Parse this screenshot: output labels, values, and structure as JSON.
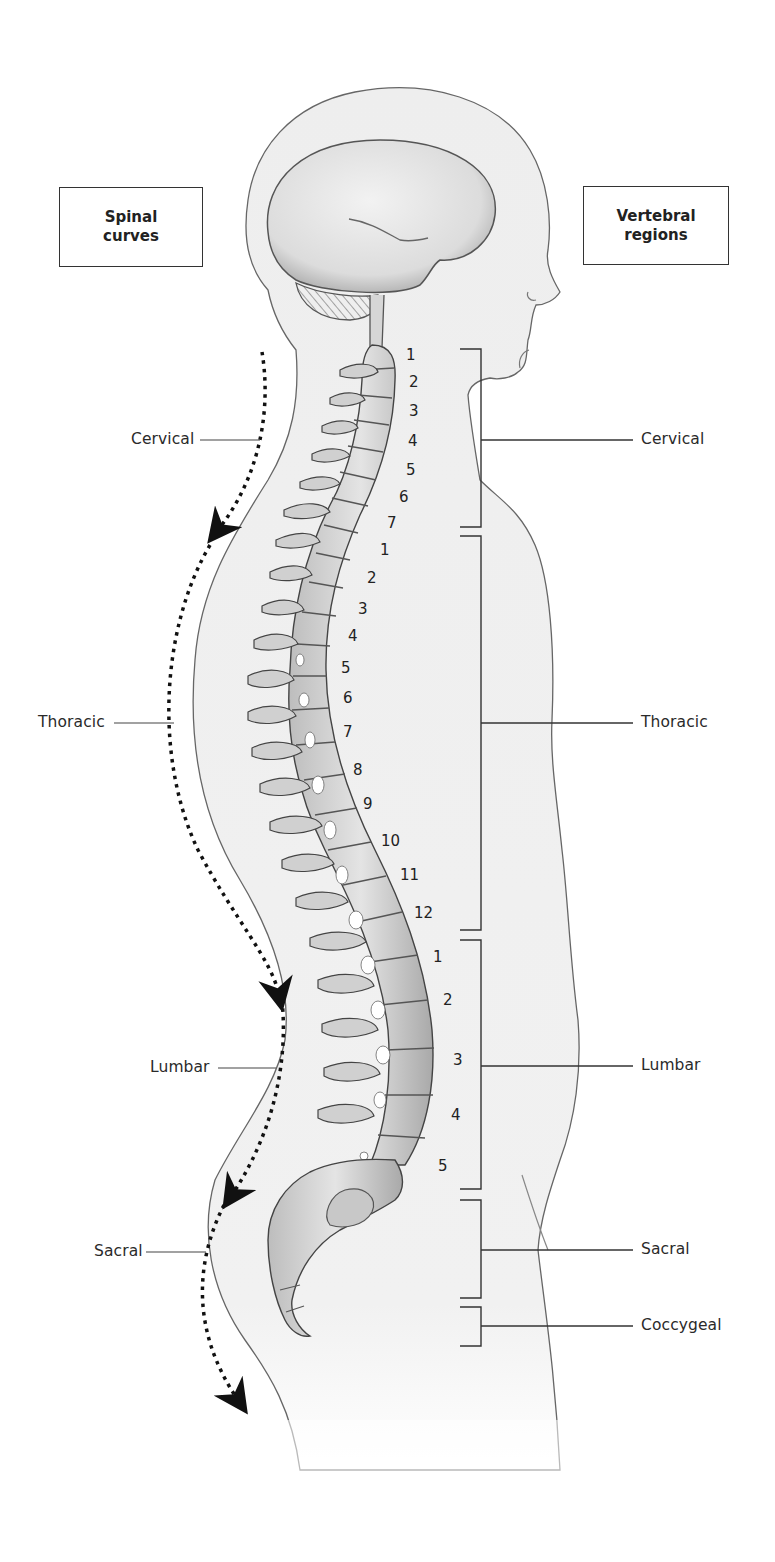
{
  "diagram": {
    "left_box": {
      "line1": "Spinal",
      "line2": "curves"
    },
    "right_box": {
      "line1": "Vertebral",
      "line2": "regions"
    },
    "spinal_curves": [
      {
        "label": "Cervical",
        "x": 131,
        "y": 430
      },
      {
        "label": "Thoracic",
        "x": 38,
        "y": 714
      },
      {
        "label": "Lumbar",
        "x": 150,
        "y": 1058
      },
      {
        "label": "Sacral",
        "x": 94,
        "y": 1242
      }
    ],
    "vertebral_regions": [
      {
        "label": "Cervical",
        "x": 641,
        "y": 430
      },
      {
        "label": "Thoracic",
        "x": 641,
        "y": 714
      },
      {
        "label": "Lumbar",
        "x": 641,
        "y": 1056
      },
      {
        "label": "Sacral",
        "x": 641,
        "y": 1240
      },
      {
        "label": "Coccygeal",
        "x": 641,
        "y": 1318
      }
    ],
    "vertebra_numbers": {
      "cervical": [
        {
          "n": "1",
          "x": 406,
          "y": 346
        },
        {
          "n": "2",
          "x": 409,
          "y": 373
        },
        {
          "n": "3",
          "x": 409,
          "y": 402
        },
        {
          "n": "4",
          "x": 408,
          "y": 432
        },
        {
          "n": "5",
          "x": 406,
          "y": 461
        },
        {
          "n": "6",
          "x": 399,
          "y": 488
        },
        {
          "n": "7",
          "x": 387,
          "y": 514
        }
      ],
      "thoracic": [
        {
          "n": "1",
          "x": 380,
          "y": 541
        },
        {
          "n": "2",
          "x": 367,
          "y": 569
        },
        {
          "n": "3",
          "x": 358,
          "y": 600
        },
        {
          "n": "4",
          "x": 348,
          "y": 627
        },
        {
          "n": "5",
          "x": 341,
          "y": 659
        },
        {
          "n": "6",
          "x": 343,
          "y": 689
        },
        {
          "n": "7",
          "x": 343,
          "y": 723
        },
        {
          "n": "8",
          "x": 353,
          "y": 761
        },
        {
          "n": "9",
          "x": 363,
          "y": 795
        },
        {
          "n": "10",
          "x": 381,
          "y": 832
        },
        {
          "n": "11",
          "x": 400,
          "y": 866
        },
        {
          "n": "12",
          "x": 414,
          "y": 904
        }
      ],
      "lumbar": [
        {
          "n": "1",
          "x": 433,
          "y": 948
        },
        {
          "n": "2",
          "x": 443,
          "y": 991
        },
        {
          "n": "3",
          "x": 453,
          "y": 1051
        },
        {
          "n": "4",
          "x": 451,
          "y": 1106
        },
        {
          "n": "5",
          "x": 438,
          "y": 1157
        }
      ]
    }
  }
}
